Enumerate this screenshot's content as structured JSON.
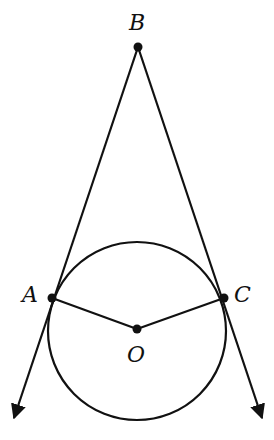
{
  "diagram": {
    "type": "geometry",
    "points": {
      "B": {
        "label": "B",
        "x": 138,
        "y": 47
      },
      "A": {
        "label": "A",
        "x": 52,
        "y": 298
      },
      "C": {
        "label": "C",
        "x": 224,
        "y": 298
      },
      "O": {
        "label": "O",
        "x": 137,
        "y": 329
      }
    },
    "circle": {
      "center": "O",
      "cx": 137,
      "cy": 331,
      "r": 89
    },
    "segments": [
      [
        "A",
        "O"
      ],
      [
        "O",
        "C"
      ]
    ],
    "rays": [
      {
        "from": "B",
        "through": "A",
        "end": {
          "x": 12,
          "y": 422
        }
      },
      {
        "from": "B",
        "through": "C",
        "end": {
          "x": 264,
          "y": 422
        }
      }
    ],
    "stroke_color": "#111111"
  }
}
